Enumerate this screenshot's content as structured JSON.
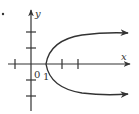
{
  "diagram": {
    "type": "parabola-graph",
    "equation_shape": "x = y^2 + 1 (opens right)",
    "axes": {
      "x_label": "x",
      "y_label": "y",
      "origin_label": "0",
      "vertex_label": "1"
    },
    "vertex": [
      1,
      0
    ],
    "x_ticks": [
      -1,
      1,
      2,
      3
    ],
    "y_ticks": [
      -2,
      -1,
      1,
      2
    ],
    "colors": {
      "stroke": "#333333",
      "background": "#ffffff"
    }
  }
}
